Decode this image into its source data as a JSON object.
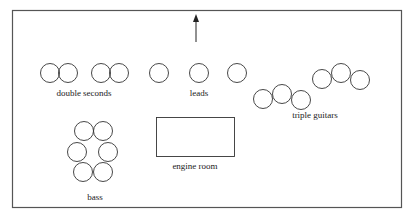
{
  "diagram": {
    "direction_arrow": "up",
    "labels": {
      "double_seconds": "double seconds",
      "leads": "leads",
      "triple_guitars": "triple guitars",
      "engine_room": "engine room",
      "bass": "bass"
    },
    "groups": [
      {
        "name": "double seconds",
        "drums": 4
      },
      {
        "name": "leads",
        "drums": 3
      },
      {
        "name": "triple guitars",
        "drums": 6
      },
      {
        "name": "bass",
        "drums": 6
      },
      {
        "name": "engine room",
        "drums": 0
      }
    ]
  }
}
